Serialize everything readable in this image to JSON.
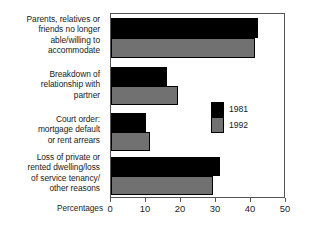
{
  "chart_data": {
    "type": "bar",
    "orientation": "horizontal",
    "title": "",
    "xlabel": "Percentages",
    "ylabel": "",
    "xlim": [
      0,
      50
    ],
    "xticks": [
      0,
      10,
      20,
      30,
      40,
      50
    ],
    "grid": false,
    "legend_position": "inside-right",
    "categories": [
      "Parents, relatives or friends no longer able/willing to accommodate",
      "Breakdown of relationship with partner",
      "Court order: mortgage default or rent arrears",
      "Loss of private or rented dwelling/loss of service tenancy/other reasons"
    ],
    "category_lines": [
      [
        "Parents, relatives or",
        "friends no longer",
        "able/willing to",
        "accommodate"
      ],
      [
        "Breakdown of",
        "relationship with",
        "partner"
      ],
      [
        "Court order:",
        "mortgage default",
        "or rent arrears"
      ],
      [
        "Loss of private or",
        "rented dwelling/loss",
        "of service tenancy/",
        "other reasons"
      ]
    ],
    "series": [
      {
        "name": "1981",
        "color": "#000000",
        "values": [
          42,
          16,
          10,
          31
        ]
      },
      {
        "name": "1992",
        "color": "#717171",
        "values": [
          41,
          19,
          11,
          29
        ]
      }
    ]
  },
  "legend": {
    "entries": [
      {
        "label": "1981"
      },
      {
        "label": "1992"
      }
    ]
  },
  "axis": {
    "title": "Percentages",
    "tick_labels": [
      "0",
      "10",
      "20",
      "30",
      "40",
      "50"
    ]
  }
}
